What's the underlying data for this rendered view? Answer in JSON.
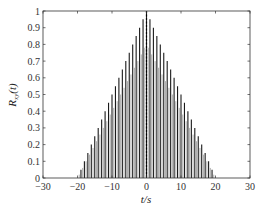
{
  "chart_data": {
    "type": "bar",
    "title": "",
    "xlabel": "t/s",
    "ylabel": "R_xy(t)",
    "xlim": [
      -30,
      30
    ],
    "ylim": [
      0,
      1
    ],
    "xticks": [
      -30,
      -20,
      -10,
      0,
      10,
      20,
      30
    ],
    "yticks": [
      0,
      0.1,
      0.2,
      0.3,
      0.4,
      0.5,
      0.6,
      0.7,
      0.8,
      0.9,
      1
    ],
    "grid": false,
    "legend": null,
    "series": [
      {
        "name": "R_xy(t)",
        "x": [
          -20,
          -19,
          -18,
          -17,
          -16,
          -15,
          -14,
          -13,
          -12,
          -11,
          -10,
          -9,
          -8,
          -7,
          -6,
          -5,
          -4,
          -3,
          -2,
          -1,
          0,
          1,
          2,
          3,
          4,
          5,
          6,
          7,
          8,
          9,
          10,
          11,
          12,
          13,
          14,
          15,
          16,
          17,
          18,
          19,
          20
        ],
        "values": [
          0.0,
          0.05,
          0.1,
          0.15,
          0.2,
          0.25,
          0.3,
          0.35,
          0.4,
          0.45,
          0.5,
          0.55,
          0.6,
          0.65,
          0.7,
          0.75,
          0.8,
          0.85,
          0.9,
          0.95,
          1.0,
          0.95,
          0.9,
          0.85,
          0.8,
          0.75,
          0.7,
          0.65,
          0.6,
          0.55,
          0.5,
          0.45,
          0.4,
          0.35,
          0.3,
          0.25,
          0.2,
          0.15,
          0.1,
          0.05,
          0.0
        ]
      }
    ]
  },
  "colors": {
    "bars": "#1a1a1a",
    "axis": "#333333",
    "center_line": "#000000"
  }
}
